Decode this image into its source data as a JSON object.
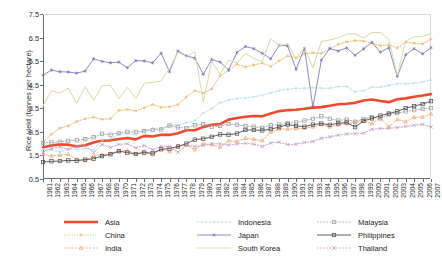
{
  "chart_data": {
    "type": "line",
    "title": "",
    "xlabel": "",
    "ylabel": "Rice yield (tonnes per hectare)",
    "ylim": [
      0.5,
      7.5
    ],
    "yticks": [
      0.5,
      1.5,
      2.5,
      3.5,
      4.5,
      5.5,
      6.5,
      7.5
    ],
    "ytick_labels": [
      "0.5",
      "1.5",
      "2.5",
      "3.5",
      "4.5",
      "5.5",
      "6.5",
      "7.5"
    ],
    "grid": false,
    "legend_position": "bottom",
    "x": [
      1961,
      1962,
      1963,
      1964,
      1965,
      1966,
      1967,
      1968,
      1969,
      1970,
      1971,
      1972,
      1973,
      1974,
      1975,
      1976,
      1977,
      1978,
      1979,
      1980,
      1981,
      1982,
      1983,
      1984,
      1985,
      1986,
      1987,
      1988,
      1989,
      1990,
      1991,
      1992,
      1993,
      1994,
      1995,
      1996,
      1997,
      1998,
      1999,
      2000,
      2001,
      2002,
      2003,
      2004,
      2005,
      2006,
      2007
    ],
    "xtick_labels": [
      "1961",
      "1962",
      "1963",
      "1964",
      "1965",
      "1966",
      "1967",
      "1968",
      "1969",
      "1970",
      "1971",
      "1972",
      "1973",
      "1974",
      "1975",
      "1976",
      "1977",
      "1978",
      "1979",
      "1980",
      "1981",
      "1982",
      "1983",
      "1984",
      "1985",
      "1986",
      "1987",
      "1988",
      "1989",
      "1990",
      "1991",
      "1992",
      "1993",
      "1994",
      "1995",
      "1996",
      "1997",
      "1998",
      "1999",
      "2000",
      "2001",
      "2002",
      "2003",
      "2004",
      "2005",
      "2006",
      "2007"
    ],
    "series": [
      {
        "name": "Asia",
        "color": "#ef4a2c",
        "marker": "none",
        "width": 2.6,
        "dash": "none",
        "values": [
          1.85,
          1.92,
          1.97,
          1.95,
          1.88,
          1.93,
          2.05,
          2.13,
          2.14,
          2.2,
          2.24,
          2.18,
          2.33,
          2.3,
          2.38,
          2.37,
          2.44,
          2.57,
          2.57,
          2.71,
          2.8,
          2.83,
          3.02,
          3.09,
          3.14,
          3.17,
          3.16,
          3.28,
          3.38,
          3.42,
          3.44,
          3.48,
          3.53,
          3.55,
          3.61,
          3.67,
          3.69,
          3.73,
          3.83,
          3.87,
          3.81,
          3.76,
          3.88,
          3.92,
          3.99,
          4.04,
          4.1
        ]
      },
      {
        "name": "China",
        "color": "#e8a33d",
        "marker": "dot",
        "width": 0.8,
        "dash": "1,1.6",
        "values": [
          2.06,
          2.4,
          2.66,
          2.75,
          2.94,
          3.05,
          3.12,
          3.03,
          3.06,
          3.41,
          3.45,
          3.39,
          3.52,
          3.66,
          3.54,
          3.56,
          3.66,
          3.98,
          4.25,
          4.14,
          4.32,
          4.89,
          5.1,
          5.37,
          5.25,
          5.34,
          5.41,
          5.27,
          5.51,
          5.72,
          5.64,
          5.8,
          5.85,
          5.83,
          6.02,
          6.21,
          6.32,
          6.37,
          6.35,
          6.26,
          6.16,
          6.19,
          6.06,
          6.31,
          6.26,
          6.23,
          6.43
        ]
      },
      {
        "name": "India",
        "color": "#f0a06a",
        "marker": "triangle",
        "width": 0.8,
        "dash": "2,1.6",
        "values": [
          1.54,
          1.48,
          1.51,
          1.55,
          1.33,
          1.29,
          1.48,
          1.53,
          1.58,
          1.68,
          1.71,
          1.57,
          1.66,
          1.54,
          1.78,
          1.66,
          1.87,
          1.94,
          1.74,
          2.0,
          1.96,
          1.84,
          2.12,
          2.09,
          2.23,
          2.18,
          2.13,
          2.49,
          2.62,
          2.62,
          2.63,
          2.66,
          2.71,
          2.81,
          2.71,
          2.8,
          2.85,
          2.89,
          2.96,
          2.85,
          3.09,
          2.71,
          3.03,
          2.93,
          3.12,
          3.13,
          3.26
        ]
      },
      {
        "name": "Indonesia",
        "color": "#aedde3",
        "marker": "dot",
        "width": 0.9,
        "dash": "2.2,1.8",
        "values": [
          1.76,
          1.73,
          1.64,
          1.78,
          1.76,
          1.79,
          1.74,
          2.14,
          2.22,
          2.38,
          2.43,
          2.37,
          2.56,
          2.64,
          2.63,
          2.78,
          2.79,
          2.89,
          2.98,
          3.29,
          3.49,
          3.74,
          3.85,
          3.91,
          3.94,
          3.99,
          4.05,
          4.15,
          4.25,
          4.3,
          4.35,
          4.35,
          4.38,
          4.35,
          4.35,
          4.42,
          4.43,
          4.2,
          4.25,
          4.4,
          4.39,
          4.47,
          4.54,
          4.54,
          4.57,
          4.62,
          4.71
        ]
      },
      {
        "name": "Japan",
        "color": "#6f6fb5",
        "marker": "asterisk",
        "width": 0.8,
        "dash": "none",
        "values": [
          4.9,
          5.12,
          5.05,
          5.04,
          4.99,
          5.08,
          5.6,
          5.49,
          5.43,
          5.46,
          5.22,
          5.52,
          5.51,
          5.43,
          5.84,
          5.05,
          5.93,
          5.72,
          5.63,
          4.94,
          5.57,
          5.46,
          5.13,
          5.87,
          6.12,
          6.03,
          5.83,
          5.6,
          6.17,
          6.15,
          5.15,
          6.05,
          3.56,
          5.54,
          6.04,
          5.93,
          6.06,
          5.75,
          6.02,
          6.3,
          5.88,
          6.07,
          4.85,
          5.77,
          6.03,
          5.81,
          6.07
        ]
      },
      {
        "name": "South Korea",
        "color": "#ddd9a3",
        "marker": "none",
        "width": 1.0,
        "dash": "none",
        "values": [
          3.6,
          4.25,
          4.15,
          4.36,
          3.72,
          4.42,
          3.83,
          4.45,
          4.48,
          3.91,
          4.39,
          3.92,
          4.56,
          4.6,
          4.66,
          5.19,
          5.88,
          5.69,
          5.9,
          3.76,
          5.49,
          4.95,
          5.54,
          5.42,
          5.84,
          5.61,
          5.49,
          6.46,
          6.15,
          6.25,
          5.59,
          6.1,
          5.22,
          6.33,
          6.4,
          6.48,
          6.65,
          6.66,
          6.48,
          6.71,
          6.72,
          6.41,
          4.9,
          6.35,
          6.53,
          6.55,
          6.67
        ]
      },
      {
        "name": "Malaysia",
        "color": "#9b9b9b",
        "marker": "square",
        "width": 0.8,
        "dash": "1.6,1.6",
        "values": [
          2.03,
          2.05,
          2.08,
          2.12,
          2.14,
          2.19,
          2.27,
          2.42,
          2.38,
          2.45,
          2.5,
          2.5,
          2.53,
          2.58,
          2.6,
          2.77,
          2.69,
          2.66,
          2.78,
          2.83,
          2.72,
          2.75,
          2.83,
          2.8,
          2.75,
          2.72,
          2.67,
          2.78,
          2.81,
          2.87,
          2.9,
          2.98,
          3.05,
          3.16,
          3.06,
          2.98,
          3.02,
          2.93,
          3.05,
          3.12,
          3.07,
          3.24,
          3.29,
          3.37,
          3.42,
          3.47,
          3.51
        ]
      },
      {
        "name": "Philippines",
        "color": "#4c4c4c",
        "marker": "square",
        "width": 0.9,
        "dash": "none",
        "values": [
          1.22,
          1.25,
          1.26,
          1.29,
          1.28,
          1.32,
          1.36,
          1.47,
          1.55,
          1.68,
          1.62,
          1.56,
          1.62,
          1.59,
          1.76,
          1.79,
          1.88,
          2.0,
          2.17,
          2.21,
          2.29,
          2.39,
          2.38,
          2.43,
          2.58,
          2.58,
          2.56,
          2.62,
          2.7,
          2.81,
          2.75,
          2.72,
          2.81,
          2.85,
          2.8,
          2.86,
          2.9,
          2.7,
          2.96,
          3.07,
          3.19,
          3.28,
          3.37,
          3.51,
          3.59,
          3.68,
          3.8
        ]
      },
      {
        "name": "Thailand",
        "color": "#c08fc0",
        "marker": "x",
        "width": 0.8,
        "dash": "1.6,1.6",
        "values": [
          1.64,
          1.79,
          1.86,
          1.76,
          1.89,
          1.92,
          1.62,
          1.96,
          1.84,
          1.97,
          1.99,
          1.82,
          1.92,
          1.74,
          1.89,
          1.87,
          1.64,
          1.93,
          1.88,
          1.92,
          1.99,
          1.99,
          1.94,
          1.99,
          2.01,
          1.98,
          1.88,
          2.03,
          2.06,
          1.96,
          1.98,
          2.05,
          2.09,
          2.23,
          2.29,
          2.36,
          2.41,
          2.42,
          2.44,
          2.61,
          2.64,
          2.65,
          2.68,
          2.73,
          2.78,
          2.82,
          2.71
        ]
      }
    ]
  }
}
